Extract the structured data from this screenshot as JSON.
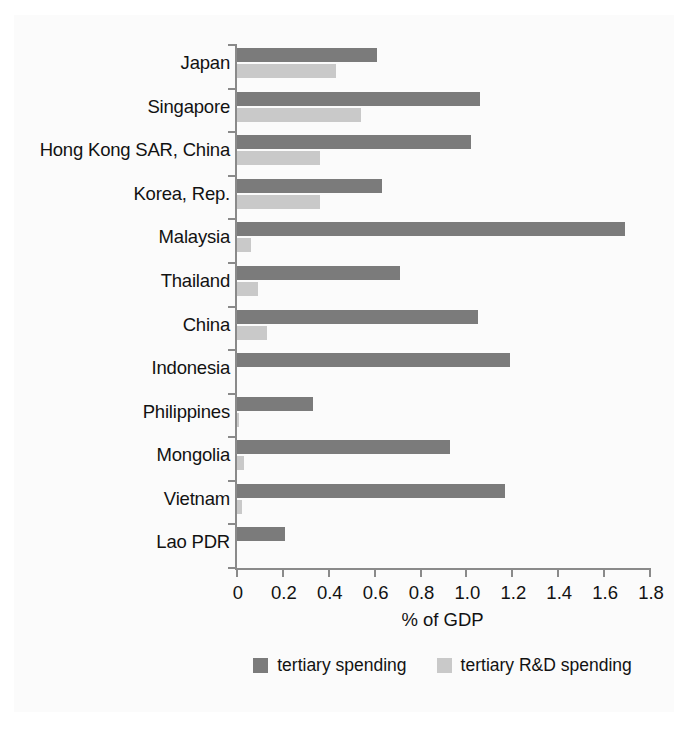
{
  "chart_data": {
    "type": "bar",
    "orientation": "horizontal",
    "title": "",
    "xlabel": "% of GDP",
    "ylabel": "",
    "xlim": [
      0,
      1.8
    ],
    "grid": false,
    "legend_position": "bottom",
    "xticks": [
      "0",
      "0.2",
      "0.4",
      "0.6",
      "0.8",
      "1.0",
      "1.2",
      "1.4",
      "1.6",
      "1.8"
    ],
    "xtick_values": [
      0,
      0.2,
      0.4,
      0.6,
      0.8,
      1.0,
      1.2,
      1.4,
      1.6,
      1.8
    ],
    "categories": [
      "Japan",
      "Singapore",
      "Hong Kong SAR, China",
      "Korea, Rep.",
      "Malaysia",
      "Thailand",
      "China",
      "Indonesia",
      "Philippines",
      "Mongolia",
      "Vietnam",
      "Lao PDR"
    ],
    "series": [
      {
        "name": "tertiary spending",
        "color": "#7b7b7b",
        "values": [
          0.61,
          1.06,
          1.02,
          0.63,
          1.69,
          0.71,
          1.05,
          1.19,
          0.33,
          0.93,
          1.17,
          0.21
        ]
      },
      {
        "name": "tertiary R&D spending",
        "color": "#c9c9c9",
        "values": [
          0.43,
          0.54,
          0.36,
          0.36,
          0.06,
          0.09,
          0.13,
          0.0,
          0.01,
          0.03,
          0.02,
          0.0
        ]
      }
    ]
  },
  "legend": {
    "items": [
      {
        "label": "tertiary spending",
        "color": "#7b7b7b"
      },
      {
        "label": "tertiary R&D spending",
        "color": "#c9c9c9"
      }
    ]
  },
  "axis": {
    "x_title": "% of GDP"
  }
}
